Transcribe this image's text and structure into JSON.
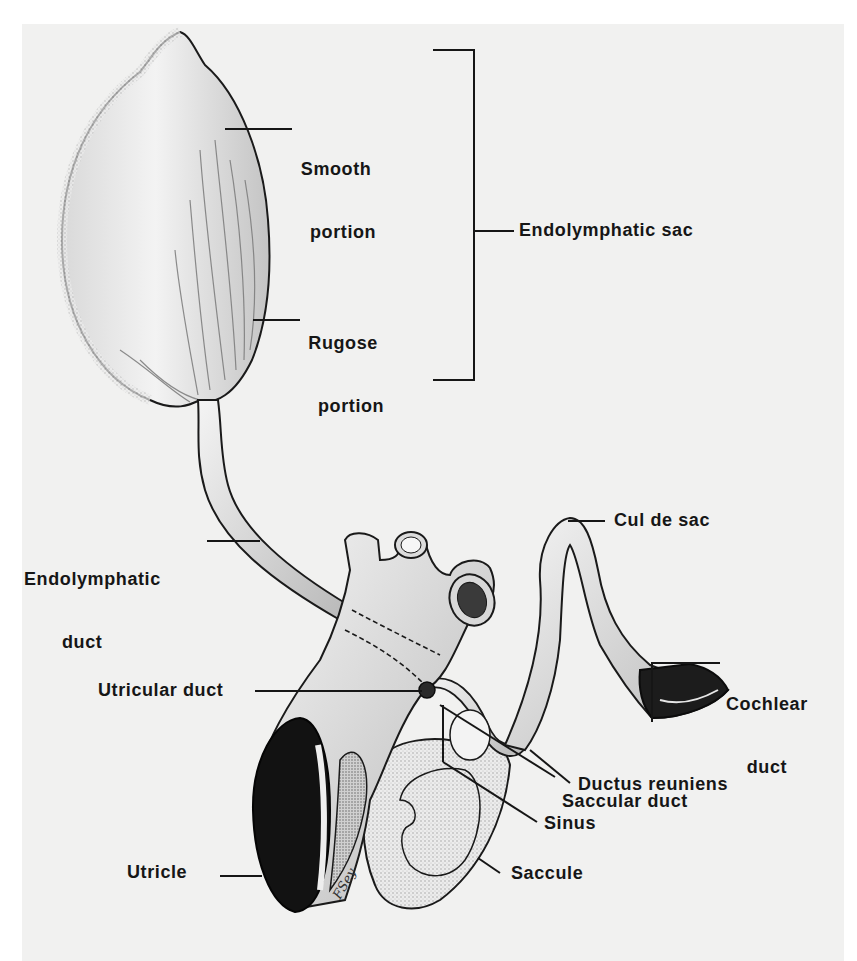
{
  "figure": {
    "colors": {
      "background": "#ffffff",
      "plate": "#f1f1f0",
      "ink": "#161616",
      "shading": "#8a8a8a"
    },
    "labels": {
      "smooth_portion": {
        "line1": "Smooth",
        "line2": "portion"
      },
      "rugose_portion": {
        "line1": "Rugose",
        "line2": "portion"
      },
      "endolymphatic_sac": "Endolymphatic sac",
      "endolymphatic_duct": {
        "line1": "Endolymphatic",
        "line2": "duct"
      },
      "cul_de_sac": "Cul de sac",
      "cochlear_duct": {
        "line1": "Cochlear",
        "line2": "duct"
      },
      "utricular_duct": "Utricular duct",
      "ductus_reuniens": "Ductus reuniens",
      "saccular_duct": "Saccular duct",
      "sinus": "Sinus",
      "utricle": "Utricle",
      "saccule": "Saccule"
    },
    "artist_signature": "F.Sey"
  }
}
